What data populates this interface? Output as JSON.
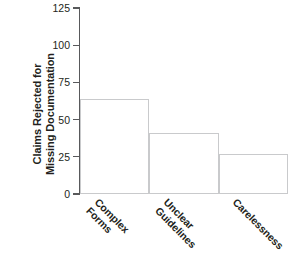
{
  "chart_data": {
    "type": "bar",
    "title": "",
    "xlabel": "",
    "ylabel": "Claims Rejected for Missing Documentation",
    "ylabel_lines": [
      "Claims Rejected for",
      "Missing Documentation"
    ],
    "categories": [
      "Complex Forms",
      "Unclear Guidelines",
      "Carelessness"
    ],
    "category_lines": [
      [
        "Complex",
        "Forms"
      ],
      [
        "Unclear",
        "Guidelines"
      ],
      [
        "Carelessness"
      ]
    ],
    "values": [
      64,
      41,
      27
    ],
    "ylim": [
      0,
      125
    ],
    "yticks": [
      0,
      25,
      50,
      75,
      100,
      125
    ],
    "ytick_labels": [
      "0",
      "25",
      "50",
      "75",
      "100",
      "125"
    ],
    "grid": false,
    "legend": false,
    "bar_style": {
      "fill": "#ffffff",
      "border": "#c9cacc",
      "gap": 0
    },
    "axis_color": "#58595b",
    "text_color": "#231f20"
  }
}
